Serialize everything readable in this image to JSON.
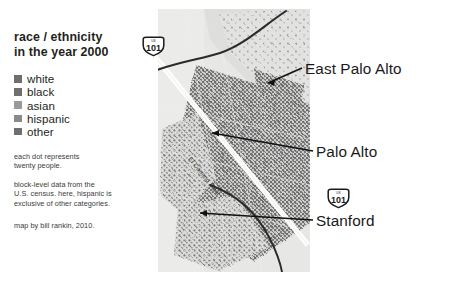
{
  "legend": {
    "title_line1": "race / ethnicity",
    "title_line2": "in the year 2000",
    "keys": [
      {
        "label": "white",
        "color": "#6f6f6f"
      },
      {
        "label": "black",
        "color": "#6f6f6f"
      },
      {
        "label": "asian",
        "color": "#9a9a9a"
      },
      {
        "label": "hispanic",
        "color": "#8a8a8a"
      },
      {
        "label": "other",
        "color": "#6f6f6f"
      }
    ],
    "note_dot_line1": "each dot represents",
    "note_dot_line2": "twenty people.",
    "note_source_line1": "block-level data from the",
    "note_source_line2": "U.S. census. here, hispanic is",
    "note_source_line3": "exclusive of other categories.",
    "credit": "map by bill rankin, 2010."
  },
  "map": {
    "road_label": "El Camino Real",
    "shields": [
      {
        "name": "us-101-northwest",
        "route": "101",
        "banner": "US"
      },
      {
        "name": "us-101-southeast",
        "route": "101",
        "banner": "US"
      }
    ],
    "callouts": [
      {
        "name": "east-palo-alto",
        "label": "East Palo Alto"
      },
      {
        "name": "palo-alto",
        "label": "Palo Alto"
      },
      {
        "name": "stanford",
        "label": "Stanford"
      }
    ]
  },
  "colors": {
    "ink": "#231f20",
    "map_base": "#e7e7e5",
    "dot_dense": "#6d6d6d",
    "dot_light": "#9c9c9c",
    "road_dark": "#2b2b2b",
    "highway_white": "#ffffff"
  }
}
